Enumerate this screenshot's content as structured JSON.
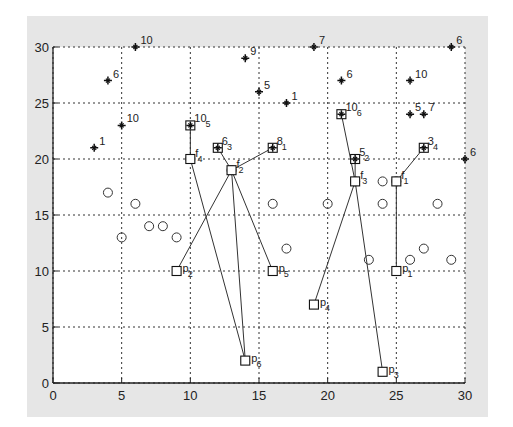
{
  "chart_data": {
    "type": "scatter",
    "title": "",
    "xlabel": "",
    "ylabel": "",
    "xlim": [
      0,
      30
    ],
    "ylim": [
      0,
      30
    ],
    "xticks": [
      0,
      5,
      10,
      15,
      20,
      25,
      30
    ],
    "yticks": [
      0,
      5,
      10,
      15,
      20,
      25,
      30
    ],
    "grid": true,
    "legend": null,
    "series": [
      {
        "name": "stars",
        "marker": "star",
        "points": [
          {
            "x": 3,
            "y": 21,
            "label": "1"
          },
          {
            "x": 4,
            "y": 27,
            "label": "6"
          },
          {
            "x": 5,
            "y": 23,
            "label": "10"
          },
          {
            "x": 6,
            "y": 30,
            "label": "10"
          },
          {
            "x": 14,
            "y": 29,
            "label": "9"
          },
          {
            "x": 15,
            "y": 26,
            "label": "5"
          },
          {
            "x": 17,
            "y": 25,
            "label": "1"
          },
          {
            "x": 19,
            "y": 30,
            "label": "7"
          },
          {
            "x": 21,
            "y": 27,
            "label": "6"
          },
          {
            "x": 26,
            "y": 27,
            "label": "10"
          },
          {
            "x": 29,
            "y": 30,
            "label": "6"
          },
          {
            "x": 26,
            "y": 24,
            "label": "5"
          },
          {
            "x": 27,
            "y": 24,
            "label": "7"
          },
          {
            "x": 30,
            "y": 20,
            "label": "6"
          }
        ]
      },
      {
        "name": "circles",
        "marker": "circle",
        "points": [
          {
            "x": 4,
            "y": 17
          },
          {
            "x": 6,
            "y": 16
          },
          {
            "x": 5,
            "y": 13
          },
          {
            "x": 7,
            "y": 14
          },
          {
            "x": 8,
            "y": 14
          },
          {
            "x": 9,
            "y": 13
          },
          {
            "x": 16,
            "y": 16
          },
          {
            "x": 20,
            "y": 16
          },
          {
            "x": 24,
            "y": 16
          },
          {
            "x": 28,
            "y": 16
          },
          {
            "x": 17,
            "y": 12
          },
          {
            "x": 23,
            "y": 11
          },
          {
            "x": 26,
            "y": 11
          },
          {
            "x": 27,
            "y": 12
          },
          {
            "x": 29,
            "y": 11
          },
          {
            "x": 24,
            "y": 18
          }
        ]
      },
      {
        "name": "facilities",
        "marker": "circle-square",
        "points": [
          {
            "x": 25,
            "y": 18,
            "label": "f",
            "sub": "1"
          },
          {
            "x": 13,
            "y": 19,
            "label": "f",
            "sub": "2"
          },
          {
            "x": 22,
            "y": 18,
            "label": "f",
            "sub": "3"
          },
          {
            "x": 10,
            "y": 20,
            "label": "f",
            "sub": "4"
          }
        ]
      },
      {
        "name": "starred-squares",
        "marker": "star-square",
        "points": [
          {
            "x": 10,
            "y": 23,
            "label": "10",
            "sub": "5"
          },
          {
            "x": 12,
            "y": 21,
            "label": "6",
            "sub": "3"
          },
          {
            "x": 16,
            "y": 21,
            "label": "8",
            "sub": "1"
          },
          {
            "x": 21,
            "y": 24,
            "label": "10",
            "sub": "6"
          },
          {
            "x": 22,
            "y": 20,
            "label": "5",
            "sub": "2"
          },
          {
            "x": 27,
            "y": 21,
            "label": "3",
            "sub": "4"
          }
        ]
      },
      {
        "name": "p-squares",
        "marker": "square",
        "points": [
          {
            "x": 25,
            "y": 10,
            "label": "p",
            "sub": "1"
          },
          {
            "x": 9,
            "y": 10,
            "label": "p",
            "sub": "2"
          },
          {
            "x": 24,
            "y": 1,
            "label": "p",
            "sub": "3"
          },
          {
            "x": 19,
            "y": 7,
            "label": "p",
            "sub": "4"
          },
          {
            "x": 16,
            "y": 10,
            "label": "p",
            "sub": "5"
          },
          {
            "x": 14,
            "y": 2,
            "label": "p",
            "sub": "6"
          }
        ]
      }
    ],
    "edges": [
      {
        "from": [
          10,
          20
        ],
        "to": [
          10,
          23
        ]
      },
      {
        "from": [
          10,
          20
        ],
        "to": [
          14,
          2
        ]
      },
      {
        "from": [
          13,
          19
        ],
        "to": [
          12,
          21
        ]
      },
      {
        "from": [
          13,
          19
        ],
        "to": [
          16,
          21
        ]
      },
      {
        "from": [
          13,
          19
        ],
        "to": [
          9,
          10
        ]
      },
      {
        "from": [
          13,
          19
        ],
        "to": [
          14,
          2
        ]
      },
      {
        "from": [
          13,
          19
        ],
        "to": [
          16,
          10
        ]
      },
      {
        "from": [
          22,
          18
        ],
        "to": [
          21,
          24
        ]
      },
      {
        "from": [
          22,
          18
        ],
        "to": [
          22,
          20
        ]
      },
      {
        "from": [
          22,
          18
        ],
        "to": [
          19,
          7
        ]
      },
      {
        "from": [
          22,
          18
        ],
        "to": [
          24,
          1
        ]
      },
      {
        "from": [
          25,
          18
        ],
        "to": [
          27,
          21
        ]
      },
      {
        "from": [
          25,
          18
        ],
        "to": [
          25,
          10
        ]
      }
    ]
  }
}
